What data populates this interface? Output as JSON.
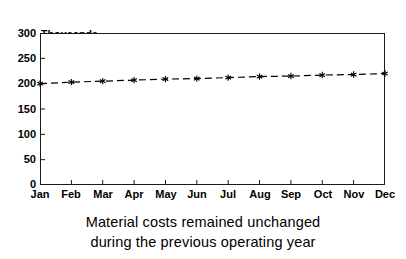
{
  "chart_data": {
    "type": "line",
    "title": "",
    "subtitle": "",
    "xlabel": "",
    "ylabel": "Thousands of Dollars",
    "ylabel_lines": [
      "Thousands",
      "of Dollars"
    ],
    "categories": [
      "Jan",
      "Feb",
      "Mar",
      "Apr",
      "May",
      "Jun",
      "Jul",
      "Aug",
      "Sep",
      "Oct",
      "Nov",
      "Dec"
    ],
    "values": [
      200,
      203,
      205,
      207,
      209,
      210,
      212,
      214,
      215,
      217,
      218,
      220
    ],
    "series": [
      {
        "name": "Material costs",
        "values": [
          200,
          203,
          205,
          207,
          209,
          210,
          212,
          214,
          215,
          217,
          218,
          220
        ],
        "line_style": "dashed",
        "marker": "asterisk",
        "color": "#000000"
      }
    ],
    "ylim": [
      0,
      300
    ],
    "yticks": [
      0,
      50,
      100,
      150,
      200,
      250,
      300
    ],
    "ytick_labels": [
      "0",
      "50",
      "100",
      "150",
      "200",
      "250",
      "300"
    ],
    "xtick_labels": [
      "Jan",
      "Feb",
      "Mar",
      "Apr",
      "May",
      "Jun",
      "Jul",
      "Aug",
      "Sep",
      "Oct",
      "Nov",
      "Dec"
    ],
    "grid": false,
    "legend": false,
    "legend_position": "none",
    "frame": true,
    "annotations": []
  },
  "caption": {
    "lines": [
      "Material costs remained unchanged",
      "during the previous operating year"
    ]
  },
  "colors": {
    "background": "#ffffff",
    "axis": "#1a1a1a",
    "text": "#000000",
    "series": "#000000"
  }
}
